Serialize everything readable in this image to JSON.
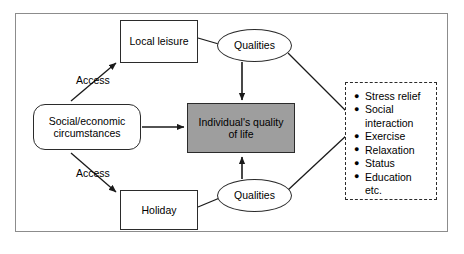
{
  "diagram": {
    "colors": {
      "frame_border": "#8c8c8c",
      "node_border": "#2b2b2b",
      "shaded_fill": "#9e9e9e",
      "background": "#ffffff",
      "connector": "#1a1a1a"
    },
    "nodes": {
      "local_leisure": {
        "label": "Local leisure",
        "shape": "rectangle"
      },
      "social_economic": {
        "label": "Social/economic\ncircumstances",
        "shape": "rounded-rectangle"
      },
      "holiday": {
        "label": "Holiday",
        "shape": "rectangle"
      },
      "quality_of_life": {
        "label": "Individual's quality\nof life",
        "shape": "rectangle-shaded"
      },
      "qualities_top": {
        "label": "Qualities",
        "shape": "ellipse"
      },
      "qualities_bottom": {
        "label": "Qualities",
        "shape": "ellipse"
      }
    },
    "edge_labels": {
      "access_top": "Access",
      "access_bottom": "Access"
    },
    "benefits": {
      "shape": "dashed-rectangle",
      "bullet_glyph": "●",
      "items": [
        {
          "text": "Stress relief",
          "bullet": true
        },
        {
          "text": "Social\ninteraction",
          "bullet": true
        },
        {
          "text": "Exercise",
          "bullet": true
        },
        {
          "text": "Relaxation",
          "bullet": true
        },
        {
          "text": "Status",
          "bullet": true
        },
        {
          "text": "Education",
          "bullet": true
        },
        {
          "text": "etc.",
          "bullet": false
        }
      ]
    }
  }
}
